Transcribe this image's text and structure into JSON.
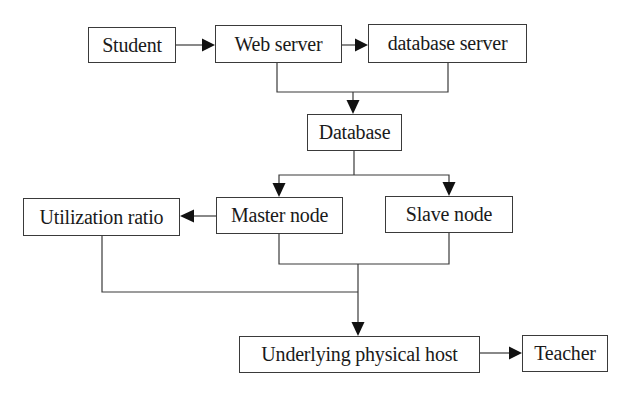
{
  "diagram": {
    "type": "flowchart",
    "nodes": {
      "student": {
        "label": "Student"
      },
      "web_server": {
        "label": "Web server"
      },
      "database_server": {
        "label": "database server"
      },
      "database": {
        "label": "Database"
      },
      "utilization_ratio": {
        "label": "Utilization ratio"
      },
      "master_node": {
        "label": "Master node"
      },
      "slave_node": {
        "label": "Slave node"
      },
      "underlying_physical_host": {
        "label": "Underlying physical host"
      },
      "teacher": {
        "label": "Teacher"
      }
    },
    "edges": [
      {
        "from": "Student",
        "to": "Web server"
      },
      {
        "from": "Web server",
        "to": "database server"
      },
      {
        "from": "Web server + database server (merged)",
        "to": "Database"
      },
      {
        "from": "Database",
        "to": "Master node"
      },
      {
        "from": "Database",
        "to": "Slave node"
      },
      {
        "from": "Master node",
        "to": "Utilization ratio"
      },
      {
        "from": "Master node + Slave node (merged)",
        "to": "Underlying physical host"
      },
      {
        "from": "Utilization ratio",
        "to": "Underlying physical host"
      },
      {
        "from": "Underlying physical host",
        "to": "Teacher"
      }
    ],
    "colors": {
      "line": "#3a3a3a",
      "arrowhead": "#111111",
      "text": "#1a1a1a",
      "background": "#ffffff"
    }
  }
}
